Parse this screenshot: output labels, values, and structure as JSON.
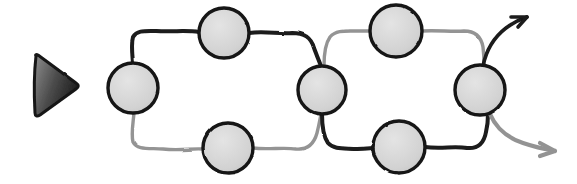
{
  "canvas": {
    "width": 577,
    "height": 184,
    "background": "#ffffff",
    "style_name": "hand-drawn-sketch"
  },
  "palette": {
    "ink_dark": "#1a1a1a",
    "ink_gray": "#8c8c8c",
    "node_fill_light": "#dcdcdc",
    "node_fill_mid": "#cccccc",
    "node_stroke": "#141414",
    "marker_fill_dark": "#2b2b2b",
    "marker_fill_light": "#9a9a9a"
  },
  "start_marker": {
    "name": "start-triangle",
    "label": "play-triangle",
    "cx": 54,
    "cy": 85,
    "width": 42,
    "height": 58,
    "direction": "right",
    "fill_dark": "#2f2f2f",
    "fill_light": "#8f8f8f",
    "stroke": "#1a1a1a"
  },
  "nodes": [
    {
      "id": "n-entry",
      "name": "node-entry",
      "cx": 133,
      "cy": 88,
      "r": 25,
      "fill": "#c9c9c9",
      "stroke": "#141414",
      "stroke_width": 3.4
    },
    {
      "id": "n-loop1-top",
      "name": "node-loop1-top",
      "cx": 224,
      "cy": 33,
      "r": 25,
      "fill": "#dadada",
      "stroke": "#141414",
      "stroke_width": 3.4
    },
    {
      "id": "n-loop1-bottom",
      "name": "node-loop1-bottom",
      "cx": 228,
      "cy": 148,
      "r": 25,
      "fill": "#d5d5d5",
      "stroke": "#141414",
      "stroke_width": 3.4
    },
    {
      "id": "n-middle",
      "name": "node-middle",
      "cx": 322,
      "cy": 90,
      "r": 24,
      "fill": "#d2d2d2",
      "stroke": "#141414",
      "stroke_width": 3.4
    },
    {
      "id": "n-loop2-top",
      "name": "node-loop2-top",
      "cx": 396,
      "cy": 31,
      "r": 26,
      "fill": "#dcdcdc",
      "stroke": "#141414",
      "stroke_width": 3.4
    },
    {
      "id": "n-loop2-bottom",
      "name": "node-loop2-bottom",
      "cx": 399,
      "cy": 147,
      "r": 26,
      "fill": "#d0d0d0",
      "stroke": "#141414",
      "stroke_width": 3.4
    },
    {
      "id": "n-exit",
      "name": "node-exit",
      "cx": 480,
      "cy": 90,
      "r": 25,
      "fill": "#d6d6d6",
      "stroke": "#141414",
      "stroke_width": 3.4
    }
  ],
  "edges": [
    {
      "id": "e1-up",
      "name": "edge-entry-to-loop1-top",
      "from": "n-entry",
      "to": "n-loop1-top",
      "tone": "dark",
      "color": "#1a1a1a",
      "width": 4.0,
      "d": "M 133 63 C 132 52 131 44 133 37 C 137 30 145 31 156 31 C 173 32 187 30 199 32"
    },
    {
      "id": "e2-top",
      "name": "edge-loop1-top-to-middle",
      "from": "n-loop1-top",
      "to": "n-middle",
      "tone": "dark",
      "color": "#1a1a1a",
      "width": 4.0,
      "d": "M 249 33 C 264 31 279 34 292 33 C 304 33 311 37 314 48 C 317 56 319 61 321 66"
    },
    {
      "id": "e3-down",
      "name": "edge-entry-to-loop1-bottom",
      "from": "n-entry",
      "to": "n-loop1-bottom",
      "tone": "light",
      "color": "#949494",
      "width": 3.4,
      "d": "M 134 113 C 133 124 131 134 133 142 C 137 150 148 148 163 149 C 181 151 192 148 203 149"
    },
    {
      "id": "e4-bottom",
      "name": "edge-loop1-bottom-to-middle",
      "from": "n-loop1-bottom",
      "to": "n-middle",
      "tone": "light",
      "color": "#949494",
      "width": 3.4,
      "d": "M 253 148 C 268 150 283 147 296 149 C 308 150 314 144 317 133 C 319 125 320 119 321 114"
    },
    {
      "id": "e5-up2",
      "name": "edge-middle-to-loop2-top",
      "from": "n-middle",
      "to": "n-loop2-top",
      "tone": "light",
      "color": "#949494",
      "width": 3.4,
      "d": "M 324 66 C 324 54 325 44 330 37 C 336 30 345 31 356 31 C 363 31 369 31 370 31"
    },
    {
      "id": "e6-top2",
      "name": "edge-loop2-top-to-exit",
      "from": "n-loop2-top",
      "to": "n-exit",
      "tone": "light",
      "color": "#949494",
      "width": 3.4,
      "d": "M 422 31 C 437 30 452 32 464 31 C 475 31 481 36 483 47 C 484 55 484 60 484 65"
    },
    {
      "id": "e7-down2",
      "name": "edge-middle-to-loop2-bottom",
      "from": "n-middle",
      "to": "n-loop2-bottom",
      "tone": "dark",
      "color": "#1a1a1a",
      "width": 4.0,
      "d": "M 322 114 C 322 126 323 136 328 143 C 334 150 345 148 357 149 C 366 149 371 148 373 148"
    },
    {
      "id": "e8-bottom2",
      "name": "edge-loop2-bottom-to-exit",
      "from": "n-loop2-bottom",
      "to": "n-exit",
      "tone": "dark",
      "color": "#1a1a1a",
      "width": 4.0,
      "d": "M 425 147 C 440 149 455 146 467 148 C 478 149 484 143 486 132 C 488 124 488 119 488 114"
    }
  ],
  "arrows": [
    {
      "id": "a-top",
      "name": "arrow-exit-up-right",
      "tone": "dark",
      "color": "#1a1a1a",
      "width": 3.6,
      "d": "M 483 66 C 486 51 493 38 506 28 C 514 22 521 19 527 17",
      "head": "M 527 17 L 511 17 M 527 17 L 518 27",
      "head_width": 3.6,
      "direction": "up-right"
    },
    {
      "id": "a-bottom",
      "name": "arrow-exit-down-right",
      "tone": "light",
      "color": "#939393",
      "width": 4.2,
      "d": "M 490 114 C 496 128 508 138 523 143 C 535 147 544 149 551 150",
      "head": "M 555 151 L 540 143 M 555 151 L 540 156",
      "head_width": 4.2,
      "direction": "down-right"
    }
  ],
  "legend": {
    "dark_route_name": "primary-path",
    "light_route_name": "secondary-path",
    "node_count": "7",
    "loop_count": "2",
    "arrow_count": "2"
  }
}
